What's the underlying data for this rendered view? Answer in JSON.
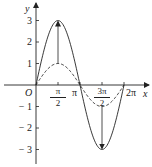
{
  "chart_data": {
    "type": "line",
    "title": "",
    "xlabel": "x",
    "ylabel": "y",
    "origin_label": "O",
    "xlim": [
      0,
      6.6
    ],
    "ylim": [
      -3.4,
      3.6
    ],
    "x_ticks": [
      {
        "value": 1.5708,
        "num": "π",
        "den": "2"
      },
      {
        "value": 3.1416,
        "label": "π"
      },
      {
        "value": 4.7124,
        "num": "3π",
        "den": "2"
      },
      {
        "value": 6.2832,
        "label": "2π"
      }
    ],
    "y_ticks": [
      {
        "value": 3,
        "label": "3"
      },
      {
        "value": 2,
        "label": "2"
      },
      {
        "value": 1,
        "label": "1"
      },
      {
        "value": -1,
        "label": "− 1"
      },
      {
        "value": -2,
        "label": "− 2"
      },
      {
        "value": -3,
        "label": "− 3"
      }
    ],
    "series": [
      {
        "name": "y = 3 sin x",
        "style": "solid",
        "amplitude": 3,
        "domain": [
          0,
          6.2832
        ]
      },
      {
        "name": "y = sin x",
        "style": "dashed",
        "amplitude": 1,
        "domain": [
          0,
          6.2832
        ]
      }
    ],
    "annotations": [
      {
        "type": "arrow",
        "from": [
          1.5708,
          1
        ],
        "to": [
          1.5708,
          3
        ]
      },
      {
        "type": "arrow",
        "from": [
          4.7124,
          -1
        ],
        "to": [
          4.7124,
          -3
        ]
      }
    ],
    "grid": false,
    "legend": "none"
  },
  "colors": {
    "line": "#222222"
  }
}
